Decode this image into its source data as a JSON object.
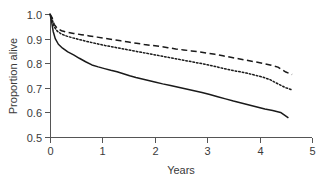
{
  "chart_data": {
    "type": "line",
    "title": "",
    "xlabel": "Years",
    "ylabel": "Proportion alive",
    "xlim": [
      0,
      5
    ],
    "ylim": [
      0.5,
      1.0
    ],
    "xticks": [
      0,
      1,
      2,
      3,
      4,
      5
    ],
    "xtick_labels": [
      "0",
      "1",
      "2",
      "3",
      "4",
      "5"
    ],
    "yticks": [
      0.5,
      0.6,
      0.7,
      0.8,
      0.9,
      1.0
    ],
    "ytick_labels": [
      "0.5",
      "0.6",
      "0.7",
      "0.8",
      "0.9",
      "1.0"
    ],
    "grid": false,
    "legend": "none",
    "colors": {
      "ink": "#1a1a1a",
      "axis": "#555555",
      "text": "#3a3a3a"
    },
    "series": [
      {
        "name": "upper-curve",
        "style": "dashed",
        "x": [
          0.0,
          0.04,
          0.08,
          0.14,
          0.22,
          0.32,
          0.45,
          0.6,
          0.75,
          0.9,
          1.05,
          1.2,
          1.35,
          1.5,
          1.65,
          1.8,
          1.95,
          2.1,
          2.25,
          2.4,
          2.55,
          2.7,
          2.85,
          3.0,
          3.15,
          3.3,
          3.45,
          3.6,
          3.75,
          3.9,
          4.05,
          4.2,
          4.35,
          4.5,
          4.62
        ],
        "y": [
          1.0,
          0.985,
          0.958,
          0.941,
          0.932,
          0.926,
          0.921,
          0.916,
          0.911,
          0.906,
          0.901,
          0.896,
          0.891,
          0.886,
          0.881,
          0.876,
          0.872,
          0.868,
          0.863,
          0.858,
          0.854,
          0.85,
          0.846,
          0.841,
          0.836,
          0.83,
          0.824,
          0.818,
          0.812,
          0.806,
          0.8,
          0.793,
          0.784,
          0.764,
          0.754
        ]
      },
      {
        "name": "middle-curve",
        "style": "dotted",
        "x": [
          0.0,
          0.04,
          0.08,
          0.14,
          0.22,
          0.32,
          0.45,
          0.6,
          0.75,
          0.9,
          1.05,
          1.2,
          1.35,
          1.5,
          1.65,
          1.8,
          1.95,
          2.1,
          2.25,
          2.4,
          2.55,
          2.7,
          2.85,
          3.0,
          3.15,
          3.3,
          3.45,
          3.6,
          3.75,
          3.9,
          4.05,
          4.2,
          4.35,
          4.5,
          4.62
        ],
        "y": [
          1.0,
          0.98,
          0.948,
          0.93,
          0.918,
          0.91,
          0.902,
          0.894,
          0.886,
          0.879,
          0.872,
          0.866,
          0.86,
          0.854,
          0.848,
          0.842,
          0.836,
          0.83,
          0.824,
          0.818,
          0.812,
          0.806,
          0.8,
          0.794,
          0.787,
          0.779,
          0.772,
          0.766,
          0.76,
          0.752,
          0.744,
          0.733,
          0.716,
          0.7,
          0.692
        ]
      },
      {
        "name": "lower-curve",
        "style": "solid",
        "x": [
          0.0,
          0.03,
          0.06,
          0.1,
          0.16,
          0.24,
          0.34,
          0.45,
          0.56,
          0.68,
          0.8,
          0.92,
          1.04,
          1.16,
          1.28,
          1.4,
          1.52,
          1.64,
          1.76,
          1.88,
          2.0,
          2.15,
          2.3,
          2.45,
          2.6,
          2.75,
          2.9,
          3.05,
          3.2,
          3.35,
          3.5,
          3.65,
          3.8,
          3.95,
          4.1,
          4.25,
          4.4,
          4.55
        ],
        "y": [
          1.0,
          0.97,
          0.93,
          0.9,
          0.877,
          0.861,
          0.846,
          0.834,
          0.82,
          0.806,
          0.793,
          0.785,
          0.778,
          0.771,
          0.765,
          0.757,
          0.749,
          0.742,
          0.736,
          0.73,
          0.724,
          0.716,
          0.709,
          0.702,
          0.695,
          0.688,
          0.681,
          0.673,
          0.664,
          0.655,
          0.646,
          0.638,
          0.63,
          0.622,
          0.614,
          0.608,
          0.6,
          0.578
        ]
      }
    ]
  },
  "axes": {
    "ylabel_text": "Proportion alive",
    "xlabel_text": "Years"
  }
}
